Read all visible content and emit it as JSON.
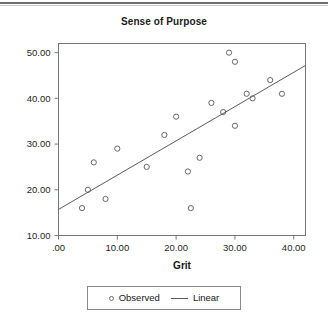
{
  "chart_data": {
    "type": "scatter",
    "title": "Sense of Purpose",
    "xlabel": "Grit",
    "ylabel": "",
    "xlim": [
      0,
      42
    ],
    "ylim": [
      10,
      52
    ],
    "grid": false,
    "x_ticks": [
      0,
      10,
      20,
      30,
      40
    ],
    "x_tick_labels": [
      ".00",
      "10.00",
      "20.00",
      "30.00",
      "40.00"
    ],
    "y_ticks": [
      10,
      20,
      30,
      40,
      50
    ],
    "y_tick_labels": [
      "10.00",
      "20.00",
      "30.00",
      "40.00",
      "50.00"
    ],
    "legend_position": "bottom",
    "series": [
      {
        "name": "Observed",
        "type": "scatter",
        "marker": "open-circle",
        "color": "#666666",
        "points": [
          {
            "x": 4,
            "y": 16
          },
          {
            "x": 5,
            "y": 20
          },
          {
            "x": 6,
            "y": 26
          },
          {
            "x": 8,
            "y": 18
          },
          {
            "x": 10,
            "y": 29
          },
          {
            "x": 15,
            "y": 25
          },
          {
            "x": 18,
            "y": 32
          },
          {
            "x": 20,
            "y": 36
          },
          {
            "x": 22,
            "y": 24
          },
          {
            "x": 22.5,
            "y": 16
          },
          {
            "x": 24,
            "y": 27
          },
          {
            "x": 26,
            "y": 39
          },
          {
            "x": 28,
            "y": 37
          },
          {
            "x": 29,
            "y": 50
          },
          {
            "x": 30,
            "y": 48
          },
          {
            "x": 30,
            "y": 34
          },
          {
            "x": 32,
            "y": 41
          },
          {
            "x": 33,
            "y": 40
          },
          {
            "x": 36,
            "y": 44
          },
          {
            "x": 38,
            "y": 41
          }
        ]
      },
      {
        "name": "Linear",
        "type": "line",
        "color": "#5b5b5b",
        "endpoints": [
          {
            "x": 0,
            "y": 15.7
          },
          {
            "x": 42,
            "y": 47.2
          }
        ]
      }
    ]
  },
  "legend": {
    "observed_label": "Observed",
    "linear_label": "Linear"
  }
}
